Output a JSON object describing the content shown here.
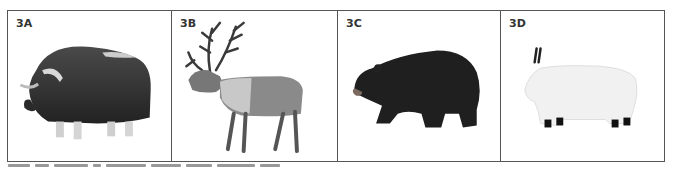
{
  "figure": {
    "panels": [
      {
        "label": "3A",
        "subject": "musk ox"
      },
      {
        "label": "3B",
        "subject": "caribou"
      },
      {
        "label": "3C",
        "subject": "black bear"
      },
      {
        "label": "3D",
        "subject": "mountain goat"
      }
    ],
    "caption": {
      "visible": "clipped",
      "text": ""
    }
  },
  "colors": {
    "border": "#555555",
    "label": "#333333",
    "background": "#ffffff"
  }
}
